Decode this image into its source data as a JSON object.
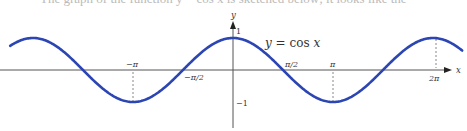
{
  "chart_data": {
    "type": "line",
    "title": "",
    "equation_label": "y = cos x",
    "function": "cos",
    "xlabel": "x",
    "ylabel": "y",
    "x_range": [
      -7.0,
      7.2
    ],
    "y_range": [
      -1,
      1
    ],
    "x_ticks": [
      {
        "value": -3.14159,
        "label": "−π",
        "position": "above"
      },
      {
        "value": -1.5708,
        "label": "−π/2",
        "position": "below"
      },
      {
        "value": 1.5708,
        "label": "π/2",
        "position": "above"
      },
      {
        "value": 3.14159,
        "label": "π",
        "position": "above"
      },
      {
        "value": 6.28319,
        "label": "2π",
        "position": "below"
      }
    ],
    "y_ticks": [
      {
        "value": 1,
        "label": "1"
      },
      {
        "value": -1,
        "label": "−1"
      }
    ],
    "dashed_guides_at_x": [
      -3.14159,
      3.14159,
      6.28319
    ],
    "series": [
      {
        "name": "y = cos x",
        "color": "#2b45b2",
        "x": [
          -7.0,
          -6.2832,
          -4.7124,
          -3.1416,
          -1.5708,
          0,
          1.5708,
          3.1416,
          4.7124,
          6.2832,
          7.2
        ],
        "values": [
          0.754,
          1,
          0,
          -1,
          0,
          1,
          0,
          -1,
          0,
          1,
          0.608
        ]
      }
    ],
    "grid": false,
    "legend": "none"
  },
  "labels": {
    "y_axis": "y",
    "x_axis": "x",
    "equation": "y = cos x",
    "one": "1",
    "neg_one": "−1",
    "neg_pi": "−π",
    "neg_half_pi": "−π/2",
    "half_pi": "π/2",
    "pi": "π",
    "two_pi": "2π"
  },
  "clipped_text": "The graph of the function y = cos x is sketched below; it looks like the"
}
